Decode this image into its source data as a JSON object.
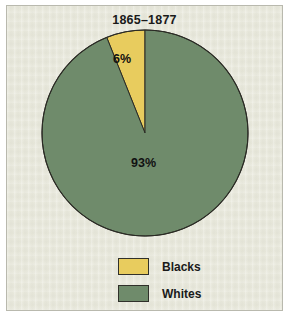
{
  "figure": {
    "title": "1865–1877",
    "background_color": "#e9e9dd",
    "border_color": "#b9b9ae",
    "outer_color": "#ffffff"
  },
  "legend": {
    "items": [
      {
        "label": "Blacks",
        "color": "#e8cc5e",
        "swatch_name": "legend-swatch-blacks"
      },
      {
        "label": "Whites",
        "color": "#6f8b6b",
        "swatch_name": "legend-swatch-whites"
      }
    ]
  },
  "labels": {
    "blacks": "6%",
    "whites": "93%"
  },
  "chart_data": {
    "type": "pie",
    "title": "1865–1877",
    "categories": [
      "Blacks",
      "Whites"
    ],
    "values": [
      6,
      93
    ],
    "value_labels": [
      "6%",
      "93%"
    ],
    "colors": [
      "#e8cc5e",
      "#6f8b6b"
    ],
    "edge_color": "#2b2b25",
    "start_angle_deg": 90,
    "direction": "counterclockwise",
    "legend_position": "bottom",
    "grid": false,
    "xlabel": "",
    "ylabel": "",
    "geometry": {
      "center_x": 145,
      "center_y": 133,
      "radius": 103
    }
  }
}
